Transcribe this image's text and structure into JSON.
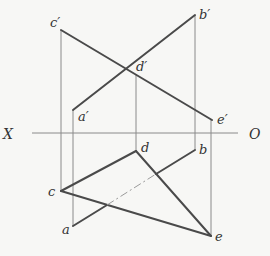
{
  "diagram": {
    "type": "orthographic-projection",
    "axis": {
      "left_label": "X",
      "right_label": "O"
    },
    "points": {
      "front_view": [
        {
          "name": "c_prime",
          "label": "c′",
          "x": 61,
          "y": 30
        },
        {
          "name": "b_prime",
          "label": "b′",
          "x": 195,
          "y": 15
        },
        {
          "name": "d_prime",
          "label": "d′",
          "x": 136,
          "y": 74
        },
        {
          "name": "a_prime",
          "label": "a′",
          "x": 73,
          "y": 110
        },
        {
          "name": "e_prime",
          "label": "e′",
          "x": 212,
          "y": 120
        }
      ],
      "top_view": [
        {
          "name": "c",
          "label": "c",
          "x": 61,
          "y": 191
        },
        {
          "name": "a",
          "label": "a",
          "x": 73,
          "y": 226
        },
        {
          "name": "d",
          "label": "d",
          "x": 136,
          "y": 151
        },
        {
          "name": "b",
          "label": "b",
          "x": 195,
          "y": 150
        },
        {
          "name": "e",
          "label": "e",
          "x": 211,
          "y": 236
        }
      ]
    },
    "labels": {
      "c_prime": "c′",
      "b_prime": "b′",
      "d_prime": "d′",
      "a_prime": "a′",
      "e_prime": "e′",
      "c": "c",
      "a": "a",
      "d": "d",
      "b": "b",
      "e": "e",
      "X": "X",
      "O": "O"
    },
    "colors": {
      "thick_line": "#4a4a4a",
      "thin_line": "#8a8a8a",
      "background": "#f7f7f5"
    }
  }
}
